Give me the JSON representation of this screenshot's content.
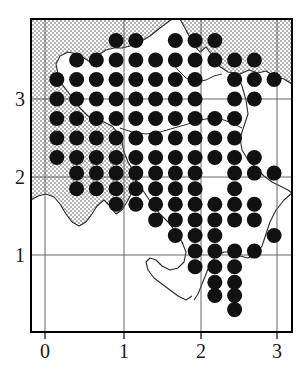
{
  "figure": {
    "kind": "distribution-dot-map",
    "background_color": "#ffffff",
    "frame_color": "#000000",
    "grid_color": "#555555",
    "dot_color": "#111111",
    "shaded_region_color": "#c9c9c9",
    "coastline_color": "#333333"
  },
  "chart_data": {
    "type": "scatter",
    "title": "",
    "subtitle": "",
    "xlabel": "",
    "ylabel": "",
    "xlim": [
      -0.18,
      3.2
    ],
    "ylim": [
      0.08,
      4.02
    ],
    "grid": true,
    "legend": null,
    "xticks": [
      0,
      1,
      2,
      3
    ],
    "xticklabels": [
      "0",
      "1",
      "2",
      "3"
    ],
    "yticks": [
      1,
      2,
      3
    ],
    "yticklabels": [
      "1",
      "2",
      "3"
    ],
    "marker": "filled-circle",
    "marker_size_px": 15,
    "grid_step": 0.25,
    "points": [
      [
        0.9,
        3.75
      ],
      [
        1.15,
        3.75
      ],
      [
        1.65,
        3.75
      ],
      [
        1.9,
        3.75
      ],
      [
        2.15,
        3.75
      ],
      [
        0.4,
        3.5
      ],
      [
        0.65,
        3.5
      ],
      [
        0.9,
        3.5
      ],
      [
        1.15,
        3.5
      ],
      [
        1.4,
        3.5
      ],
      [
        1.65,
        3.5
      ],
      [
        1.9,
        3.5
      ],
      [
        2.15,
        3.5
      ],
      [
        2.4,
        3.5
      ],
      [
        2.65,
        3.5
      ],
      [
        0.15,
        3.25
      ],
      [
        0.4,
        3.25
      ],
      [
        0.65,
        3.25
      ],
      [
        0.9,
        3.25
      ],
      [
        1.15,
        3.25
      ],
      [
        1.4,
        3.25
      ],
      [
        1.65,
        3.25
      ],
      [
        1.9,
        3.25
      ],
      [
        2.4,
        3.25
      ],
      [
        2.65,
        3.25
      ],
      [
        2.9,
        3.25
      ],
      [
        0.15,
        3.0
      ],
      [
        0.4,
        3.0
      ],
      [
        0.65,
        3.0
      ],
      [
        0.9,
        3.0
      ],
      [
        1.15,
        3.0
      ],
      [
        1.4,
        3.0
      ],
      [
        1.65,
        3.0
      ],
      [
        1.9,
        3.0
      ],
      [
        2.4,
        3.0
      ],
      [
        2.65,
        3.0
      ],
      [
        0.15,
        2.75
      ],
      [
        0.4,
        2.75
      ],
      [
        0.65,
        2.75
      ],
      [
        0.9,
        2.75
      ],
      [
        1.15,
        2.75
      ],
      [
        1.4,
        2.75
      ],
      [
        1.65,
        2.75
      ],
      [
        1.9,
        2.75
      ],
      [
        2.15,
        2.75
      ],
      [
        2.4,
        2.75
      ],
      [
        0.15,
        2.5
      ],
      [
        0.4,
        2.5
      ],
      [
        0.65,
        2.5
      ],
      [
        0.9,
        2.5
      ],
      [
        1.15,
        2.5
      ],
      [
        1.4,
        2.5
      ],
      [
        1.65,
        2.5
      ],
      [
        1.9,
        2.5
      ],
      [
        2.15,
        2.5
      ],
      [
        2.4,
        2.5
      ],
      [
        0.15,
        2.25
      ],
      [
        0.4,
        2.25
      ],
      [
        0.65,
        2.25
      ],
      [
        0.9,
        2.25
      ],
      [
        1.15,
        2.25
      ],
      [
        1.4,
        2.25
      ],
      [
        1.65,
        2.25
      ],
      [
        1.9,
        2.25
      ],
      [
        2.15,
        2.25
      ],
      [
        2.4,
        2.25
      ],
      [
        2.65,
        2.25
      ],
      [
        0.4,
        2.05
      ],
      [
        0.65,
        2.05
      ],
      [
        0.9,
        2.05
      ],
      [
        1.15,
        2.05
      ],
      [
        1.4,
        2.05
      ],
      [
        1.65,
        2.05
      ],
      [
        1.9,
        2.05
      ],
      [
        2.4,
        2.05
      ],
      [
        2.65,
        2.05
      ],
      [
        2.9,
        2.05
      ],
      [
        0.4,
        1.85
      ],
      [
        0.65,
        1.85
      ],
      [
        0.9,
        1.85
      ],
      [
        1.15,
        1.85
      ],
      [
        1.4,
        1.85
      ],
      [
        1.65,
        1.85
      ],
      [
        1.9,
        1.85
      ],
      [
        2.4,
        1.85
      ],
      [
        0.9,
        1.65
      ],
      [
        1.15,
        1.65
      ],
      [
        1.4,
        1.65
      ],
      [
        1.65,
        1.65
      ],
      [
        1.9,
        1.65
      ],
      [
        2.15,
        1.65
      ],
      [
        2.4,
        1.65
      ],
      [
        2.65,
        1.65
      ],
      [
        1.4,
        1.45
      ],
      [
        1.65,
        1.45
      ],
      [
        1.9,
        1.45
      ],
      [
        2.15,
        1.45
      ],
      [
        2.4,
        1.45
      ],
      [
        2.65,
        1.45
      ],
      [
        1.65,
        1.25
      ],
      [
        1.9,
        1.25
      ],
      [
        2.15,
        1.25
      ],
      [
        2.9,
        1.25
      ],
      [
        1.9,
        1.05
      ],
      [
        2.15,
        1.05
      ],
      [
        2.4,
        1.05
      ],
      [
        2.65,
        1.05
      ],
      [
        1.9,
        0.85
      ],
      [
        2.15,
        0.85
      ],
      [
        2.4,
        0.85
      ],
      [
        2.15,
        0.65
      ],
      [
        2.4,
        0.65
      ],
      [
        2.15,
        0.48
      ],
      [
        2.4,
        0.48
      ],
      [
        2.4,
        0.3
      ]
    ],
    "n_points": 119
  },
  "axes": {
    "x_tick_labels": [
      "0",
      "1",
      "2",
      "3"
    ],
    "y_tick_labels": [
      "1",
      "2",
      "3"
    ]
  }
}
